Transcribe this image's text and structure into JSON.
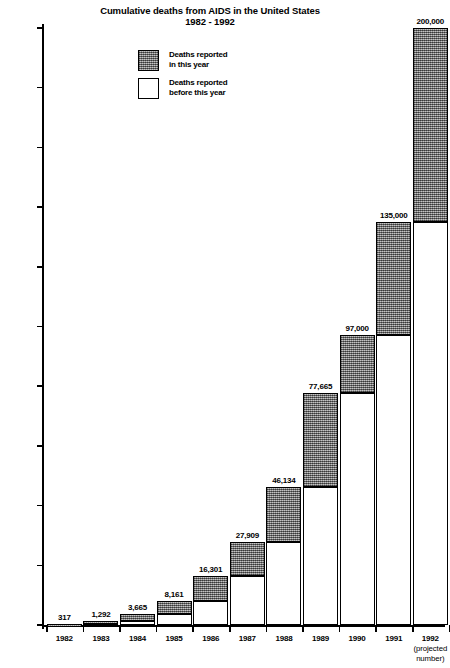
{
  "chart_data": {
    "type": "bar",
    "subtype": "stacked-bar",
    "title": "Cumulative deaths from AIDS in the United States",
    "subtitle": "1982 - 1992",
    "xlabel": "",
    "ylabel": "",
    "ylim": [
      0,
      200000
    ],
    "ytick_step": 20000,
    "grid": false,
    "legend_position": "upper-left-inside",
    "categories": [
      "1982",
      "1983",
      "1984",
      "1985",
      "1986",
      "1987",
      "1988",
      "1989",
      "1990",
      "1991",
      "1992"
    ],
    "category_sublabels": [
      "",
      "",
      "",
      "",
      "",
      "",
      "",
      "",
      "",
      "",
      "(projected\nnumber)"
    ],
    "ytick_labels": [
      "0",
      "20,000",
      "40,000",
      "60,000",
      "80,000",
      "100,000",
      "120,000",
      "140,000",
      "160,000",
      "180,000",
      "200,000"
    ],
    "ytick_values": [
      0,
      20000,
      40000,
      60000,
      80000,
      100000,
      120000,
      140000,
      160000,
      180000,
      200000
    ],
    "cumulative_totals": [
      317,
      1292,
      3665,
      8161,
      16301,
      27909,
      46134,
      77665,
      97000,
      135000,
      200000
    ],
    "cumulative_total_labels": [
      "317",
      "1,292",
      "3,665",
      "8,161",
      "16,301",
      "27,909",
      "46,134",
      "77,665",
      "97,000",
      "135,000",
      "200,000"
    ],
    "series": [
      {
        "name": "Deaths reported before this year",
        "key": "prev",
        "color": "#ffffff",
        "values": [
          0,
          317,
          1292,
          3665,
          8161,
          16301,
          27909,
          46134,
          77665,
          97000,
          135000
        ]
      },
      {
        "name": "Deaths reported in this year",
        "key": "curr",
        "color": "#8e8e8e",
        "values": [
          317,
          975,
          2373,
          4496,
          8140,
          11608,
          18225,
          31531,
          19335,
          38000,
          65000
        ]
      }
    ]
  },
  "legend": {
    "items": [
      {
        "key": "curr",
        "line1": "Deaths reported",
        "line2": "in this year"
      },
      {
        "key": "prev",
        "line1": "Deaths reported",
        "line2": "before this year"
      }
    ]
  }
}
